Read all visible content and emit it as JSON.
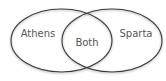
{
  "diagram": {
    "type": "venn",
    "sets": [
      {
        "label": "Athens",
        "cx": 61.5,
        "cy": 40.5,
        "rx": 50.5,
        "ry": 31.5,
        "label_x": 38,
        "label_y": 37
      },
      {
        "label": "Sparta",
        "cx": 112,
        "cy": 40.5,
        "rx": 50,
        "ry": 31.5,
        "label_x": 136,
        "label_y": 37
      }
    ],
    "intersection": {
      "label": "Both",
      "label_x": 87,
      "label_y": 46
    },
    "colors": {
      "stroke": "#3a3a3a",
      "shadow": "#9a9a9a",
      "text": "#555555",
      "background": "#ffffff"
    }
  }
}
